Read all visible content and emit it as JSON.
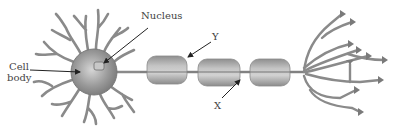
{
  "diagram": {
    "labels": {
      "cell_body_line1": "Cell",
      "cell_body_line2": "body",
      "nucleus": "Nucleus",
      "y": "Y",
      "x": "X"
    },
    "parts": [
      "dendrites",
      "cell body",
      "nucleus",
      "axon",
      "myelin sheath segments",
      "axon terminals"
    ],
    "colors": {
      "tissue": "#8a8a8a",
      "tissue_dark": "#6e6e6e",
      "myelin": "#a9a9a9",
      "arrow": "#222222",
      "text": "#444444"
    }
  }
}
